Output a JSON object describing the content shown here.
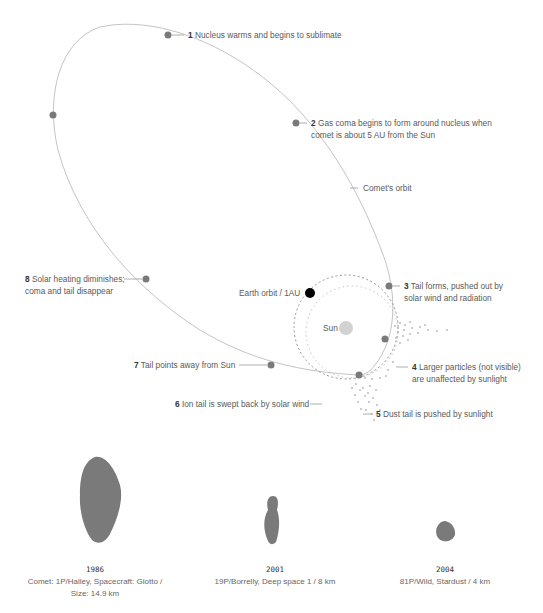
{
  "diagram": {
    "orbit_label": "Comet's orbit",
    "earth_label": "Earth orbit / 1AU",
    "sun_label": "Sun",
    "stages": [
      {
        "num": "1",
        "text": "Nucleus warms and begins to sublimate"
      },
      {
        "num": "2",
        "text": "Gas coma begins to form around nucleus when",
        "text2": "comet is about 5 AU from the Sun"
      },
      {
        "num": "3",
        "text": "Tail forms, pushed out by",
        "text2": "solar wind and radiation"
      },
      {
        "num": "4",
        "text": "Larger particles (not visible)",
        "text2": "are unaffected by sunlight"
      },
      {
        "num": "5",
        "text": "Dust tail is pushed by sunlight"
      },
      {
        "num": "6",
        "text": "Ion tail is swept back by solar wind"
      },
      {
        "num": "7",
        "text": "Tail points away from Sun"
      },
      {
        "num": "8",
        "text": "Solar heating diminishes;",
        "text2": "coma and tail disappear"
      }
    ],
    "colors": {
      "orbit": "#bdbdbd",
      "dot": "#7a7a7a",
      "earth": "#000000",
      "sun": "#cfcfcf",
      "nucleus": "#7a7a7a"
    }
  },
  "nuclei": [
    {
      "year": "1986",
      "caption": "Comet: 1P/Halley, Spacecraft: Giotto /",
      "caption2": "Size: 14.9 km"
    },
    {
      "year": "2001",
      "caption": "19P/Borrelly, Deep space 1 / 8 km"
    },
    {
      "year": "2004",
      "caption": "81P/Wild, Stardust / 4 km"
    }
  ]
}
